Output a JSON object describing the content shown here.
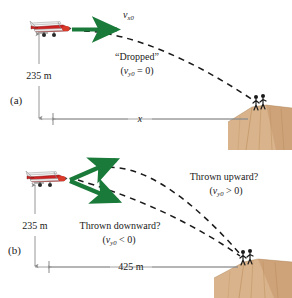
{
  "figure": {
    "accent_arrow_color": "#1a7a3a",
    "trajectory_color": "#1a1a1a",
    "dimension_line_color": "#8a8a8a",
    "cliff_color": "#d9b38c",
    "cliff_shadow_color": "#c09163",
    "plane_body_color": "#cc2222",
    "plane_wing_color": "#e8e8e8",
    "person_color": "#1a1a1a"
  },
  "panel_a": {
    "tag": "(a)",
    "velocity_label": "v",
    "velocity_sub": "x0",
    "drop_label": "“Dropped”",
    "drop_condition_open": "(",
    "drop_condition_v": "v",
    "drop_condition_sub": "y0",
    "drop_condition_rest": " = 0)",
    "height_label": "235 m",
    "range_label": "x"
  },
  "panel_b": {
    "tag": "(b)",
    "upward_label": "Thrown upward?",
    "upward_condition_open": "(",
    "upward_condition_v": "v",
    "upward_condition_sub": "y0",
    "upward_condition_rest": " > 0)",
    "downward_label": "Thrown downward?",
    "downward_condition_open": "(",
    "downward_condition_v": "v",
    "downward_condition_sub": "y0",
    "downward_condition_rest": " < 0)",
    "height_label": "235 m",
    "range_label": "425 m"
  }
}
